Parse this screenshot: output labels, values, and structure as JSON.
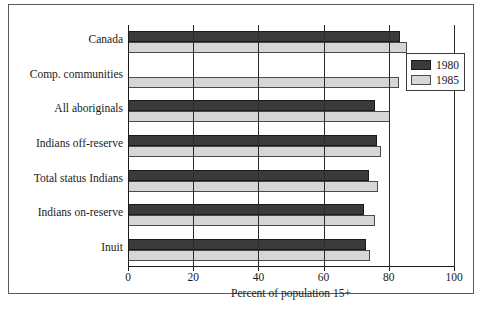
{
  "chart_data": {
    "type": "bar",
    "orientation": "horizontal",
    "title": "",
    "xlabel": "Percent of population 15+",
    "ylabel": "",
    "xlim": [
      0,
      100
    ],
    "xticks": [
      0,
      20,
      40,
      60,
      80,
      100
    ],
    "xtick_labels": [
      "0",
      "20",
      "40",
      "60",
      "80",
      "100"
    ],
    "grid": true,
    "grid_axis": "x",
    "legend_position": "upper right",
    "categories": [
      "Canada",
      "Comp. communities",
      "All aboriginals",
      "Indians off-reserve",
      "Total status Indians",
      "Indians on-reserve",
      "Inuit"
    ],
    "series": [
      {
        "name": "1980",
        "color": "#3a3a3a",
        "values": [
          83.4,
          null,
          75.8,
          76.4,
          74.0,
          72.4,
          73.0
        ]
      },
      {
        "name": "1985",
        "color": "#d6d6d6",
        "values": [
          85.6,
          83.0,
          80.4,
          77.6,
          76.7,
          75.8,
          74.2
        ]
      }
    ]
  },
  "legend": {
    "entries": [
      {
        "label": "1980",
        "swatch": "dark"
      },
      {
        "label": "1985",
        "swatch": "light"
      }
    ]
  },
  "axis": {
    "x_title": "Percent of population 15+"
  },
  "source": {
    "text": ""
  },
  "colors": {
    "series_1980": "#3a3a3a",
    "series_1985": "#d6d6d6",
    "axis": "#1a1a1a",
    "frame": "#5a5a5a",
    "background": "#ffffff"
  }
}
